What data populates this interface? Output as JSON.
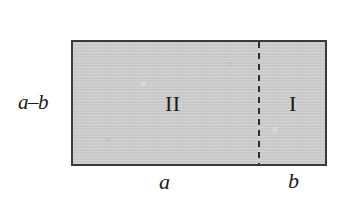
{
  "figure": {
    "background_color": "#ffffff",
    "canvas": {
      "width": 345,
      "height": 208
    }
  },
  "rectangle": {
    "fill_color": "#cdcdcd",
    "border_color": "#3a3a3a",
    "x": 71,
    "y": 40,
    "width": 256,
    "height": 126
  },
  "divider": {
    "type": "dashed-vertical-line",
    "color": "#2e2e2e",
    "x": 258,
    "dash_length": 6,
    "gap_length": 5
  },
  "labels": {
    "height_left": "a–b",
    "region_two": "II",
    "region_one": "I",
    "width_left": "a",
    "width_right": "b"
  },
  "chart_data": {
    "type": "diagram",
    "shapes": [
      {
        "name": "outer-rectangle",
        "kind": "rectangle",
        "fill": "#cdcdcd",
        "stroke": "#3a3a3a",
        "width_label": "a",
        "height_label": "a–b"
      },
      {
        "name": "region-II",
        "kind": "sub-rectangle",
        "label": "II",
        "side": "left",
        "width_label": "a"
      },
      {
        "name": "region-I",
        "kind": "sub-rectangle",
        "label": "I",
        "side": "right",
        "width_label": "b"
      }
    ],
    "annotations": [
      {
        "text": "a–b",
        "position": "left",
        "style": "italic"
      },
      {
        "text": "II",
        "position": "interior-left",
        "style": "roman-numeral"
      },
      {
        "text": "I",
        "position": "interior-right",
        "style": "roman-numeral"
      },
      {
        "text": "a",
        "position": "bottom-left",
        "style": "italic"
      },
      {
        "text": "b",
        "position": "bottom-right",
        "style": "italic"
      }
    ]
  }
}
